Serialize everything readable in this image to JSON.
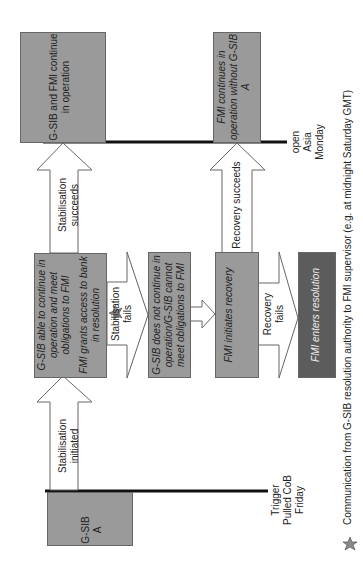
{
  "diagram": {
    "orientation": "rotated-90-ccw",
    "colors": {
      "box_fill": "#9a9a9a",
      "box_dark_fill": "#5c5c5c",
      "arrow_fill": "#ffffff",
      "line": "#111111"
    },
    "timeline": {
      "start_label": "Trigger Pulled CoB Friday",
      "end_label": "open Asia Monday"
    },
    "nodes": {
      "gsib_a": "G-SIB A",
      "gsib_able": "G-SIB able to continue in operation and meet obligations to FMI",
      "fmi_grants": "FMI grants access to bank in resolution",
      "gsib_not_continue": "G-SIB does not continue in operation/G-SIB cannot meet obligations to FMI",
      "fmi_initiates": "FMI initiates recovery",
      "fmi_enters": "FMI enters resolution",
      "both_continue": "G-SIB and FMI continue in operation",
      "fmi_continues": "FMI continues in operation without G-SIB A"
    },
    "arrows": {
      "stab_initiated": "Stabilisation initiated",
      "stab_succeeds": "Stabilisation succeeds",
      "stab_fails": "Stabilisation fails",
      "recovery_succeeds": "Recovery succeeds",
      "recovery_fails": "Recovery fails"
    },
    "legend": {
      "star_icon": "star-icon",
      "text": "Communication from G-SIB resolution authority to FMI supervisor (e.g. at midnight Saturday GMT)"
    }
  }
}
